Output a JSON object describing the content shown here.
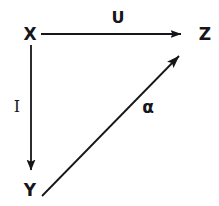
{
  "figure": {
    "type": "commutative-diagram",
    "background_color": "#ffffff",
    "ink_color": "#15151a",
    "width": 219,
    "height": 206
  },
  "nodes": [
    {
      "id": "X",
      "label": "X",
      "x": 30,
      "y": 34
    },
    {
      "id": "Y",
      "label": "Y",
      "x": 30,
      "y": 190
    },
    {
      "id": "Z",
      "label": "Z",
      "x": 205,
      "y": 34
    }
  ],
  "edges": [
    {
      "id": "X-to-Z",
      "label": "U",
      "label_x": 118,
      "label_y": 18,
      "label_style": "sans-bold",
      "from": "X",
      "to": "Z",
      "x1": 41,
      "y1": 34,
      "x2": 192,
      "y2": 34,
      "arrowhead": "filled-triangle",
      "stroke_width": 1.8
    },
    {
      "id": "X-to-Y",
      "label": "I",
      "label_x": 17,
      "label_y": 107,
      "label_style": "serif",
      "from": "X",
      "to": "Y",
      "x1": 31,
      "y1": 45,
      "x2": 31,
      "y2": 180,
      "arrowhead": "filled-triangle",
      "stroke_width": 1.8
    },
    {
      "id": "Y-to-Z",
      "label": "α",
      "label_x": 148,
      "label_y": 107,
      "label_style": "greek",
      "from": "Y",
      "to": "Z",
      "x1": 42,
      "y1": 196,
      "x2": 190,
      "y2": 45,
      "arrowhead": "filled-triangle",
      "stroke_width": 1.8
    }
  ]
}
